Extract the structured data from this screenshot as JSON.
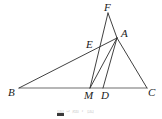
{
  "figure": {
    "type": "geometry-diagram",
    "width": 162,
    "height": 119,
    "background": "#ffffff",
    "stroke_color": "#2b2b2b",
    "baseline_color": "#6e6e6e",
    "stroke_width": 0.9,
    "points": {
      "A": {
        "x": 117,
        "y": 38,
        "label": "A",
        "label_x": 121,
        "label_y": 28
      },
      "B": {
        "x": 19,
        "y": 88,
        "label": "B",
        "label_x": 8,
        "label_y": 87
      },
      "C": {
        "x": 147,
        "y": 88,
        "label": "C",
        "label_x": 148,
        "label_y": 87
      },
      "D": {
        "x": 103,
        "y": 88,
        "label": "D",
        "label_x": 101,
        "label_y": 90
      },
      "M": {
        "x": 90,
        "y": 88,
        "label": "M",
        "label_x": 84,
        "label_y": 90
      },
      "E": {
        "x": 97,
        "y": 47,
        "label": "E",
        "label_x": 86,
        "label_y": 39
      },
      "F": {
        "x": 108,
        "y": 13,
        "label": "F",
        "label_x": 104,
        "label_y": 2
      }
    },
    "segments": [
      {
        "name": "segment-BC",
        "from": "B",
        "to": "C",
        "color": "#6e6e6e",
        "width": 1.1
      },
      {
        "name": "segment-BA",
        "from": "B",
        "to": "A",
        "color": "#2b2b2b",
        "width": 0.9
      },
      {
        "name": "segment-AC",
        "from": "A",
        "to": "C",
        "color": "#2b2b2b",
        "width": 0.9
      },
      {
        "name": "segment-AM",
        "from": "A",
        "to": "M",
        "color": "#2b2b2b",
        "width": 0.9
      },
      {
        "name": "segment-AD",
        "from": "A",
        "to": "D",
        "color": "#2b2b2b",
        "width": 0.9
      },
      {
        "name": "segment-FM",
        "from": "F",
        "to": "M",
        "color": "#2b2b2b",
        "width": 0.9
      },
      {
        "name": "segment-FA",
        "from": "F",
        "to": "A",
        "color": "#2b2b2b",
        "width": 0.9
      }
    ],
    "labels": [
      "F",
      "A",
      "E",
      "B",
      "M",
      "D",
      "C"
    ]
  },
  "caption": {
    "text": "图 3 题 7 图",
    "swatch_color": "#3a3a3a"
  }
}
